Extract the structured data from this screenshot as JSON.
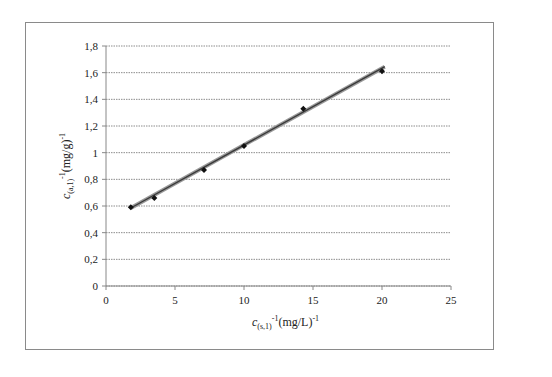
{
  "chart_data": {
    "type": "scatter",
    "title": "",
    "xlabel": "c(s,1)^-1 (mg/L)^-1",
    "ylabel": "c(a,1)^-1 (mg/g)^-1",
    "xlim": [
      0,
      25
    ],
    "ylim": [
      0,
      1.8
    ],
    "x_ticks": [
      "0",
      "5",
      "10",
      "15",
      "20",
      "25"
    ],
    "y_ticks": [
      "0",
      "0,2",
      "0,4",
      "0,6",
      "0,8",
      "1",
      "1,2",
      "1,4",
      "1,6",
      "1,8"
    ],
    "grid": "horizontal dotted",
    "legend": "none",
    "series": [
      {
        "name": "measured",
        "marker": "diamond",
        "x": [
          1.8,
          3.5,
          7.1,
          10.0,
          14.3,
          20.0
        ],
        "y": [
          0.59,
          0.66,
          0.87,
          1.05,
          1.33,
          1.61
        ]
      },
      {
        "name": "linear fit",
        "type": "line",
        "x": [
          1.8,
          20.2
        ],
        "y": [
          0.585,
          1.645
        ]
      }
    ]
  },
  "labels": {
    "y_title_main": "c",
    "y_title_sub": "(a,1)",
    "y_title_rest": "(mg/g)",
    "x_title_main": "c",
    "x_title_sub": "(s,1)",
    "x_title_rest": "(mg/L)",
    "exp": "-1"
  }
}
